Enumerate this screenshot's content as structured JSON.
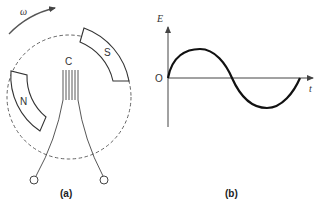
{
  "figure_a": {
    "caption": "(a)",
    "rotation_label": "ω",
    "magnet_south_label": "S",
    "magnet_north_label": "N",
    "coil_label": "C"
  },
  "figure_b": {
    "caption": "(b)",
    "y_axis_label": "E",
    "x_axis_label": "t",
    "origin_label": "O"
  },
  "colors": {
    "stroke": "#333333",
    "curve": "#111111",
    "background": "#ffffff"
  }
}
